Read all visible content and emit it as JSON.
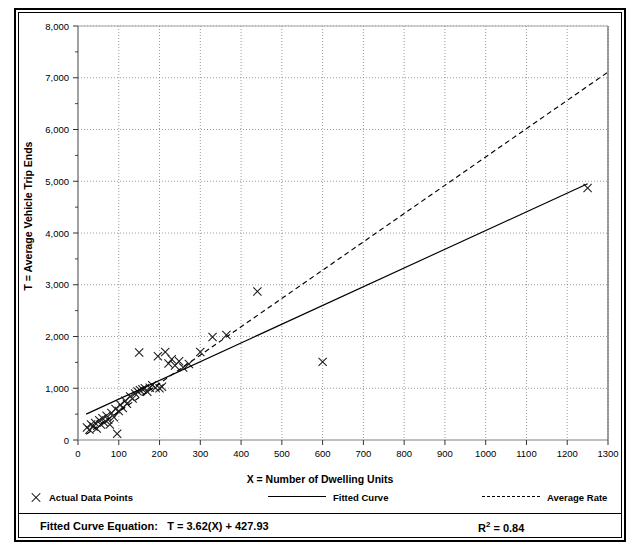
{
  "figure": {
    "title": "",
    "background": "#ffffff",
    "line_color": "#000000"
  },
  "axes": {
    "x_title": "X = Number of Dwelling Units",
    "y_title": "T = Average Vehicle Trip Ends",
    "x_ticks": [
      "0",
      "100",
      "200",
      "300",
      "400",
      "500",
      "600",
      "700",
      "800",
      "900",
      "1000",
      "1100",
      "1200",
      "1300"
    ],
    "y_ticks": [
      "0",
      "1,000",
      "2,000",
      "3,000",
      "4,000",
      "5,000",
      "6,000",
      "7,000",
      "8,000"
    ]
  },
  "legend": {
    "actual_label": "Actual Data Points",
    "fitted_label": "Fitted Curve",
    "average_label": "Average Rate"
  },
  "footer": {
    "equation_label": "Fitted Curve Equation:",
    "equation_value": "T = 3.62(X) + 427.93",
    "rsq_label": "R",
    "rsq_exp": "2",
    "rsq_value": " = 0.84"
  },
  "chart_data": {
    "type": "scatter",
    "title": "",
    "xlabel": "X = Number of Dwelling Units",
    "ylabel": "T = Average Vehicle Trip Ends",
    "xlim": [
      0,
      1300
    ],
    "ylim": [
      0,
      8000
    ],
    "x_major_step": 100,
    "y_major_step": 1000,
    "y_minor_step": 500,
    "grid": true,
    "grid_style": "dotted",
    "legend_position": "below-axes",
    "series": [
      {
        "name": "Actual Data Points",
        "type": "scatter",
        "marker": "x",
        "points": [
          [
            22,
            240
          ],
          [
            28,
            200
          ],
          [
            32,
            300
          ],
          [
            38,
            260
          ],
          [
            42,
            330
          ],
          [
            46,
            220
          ],
          [
            52,
            380
          ],
          [
            56,
            300
          ],
          [
            60,
            420
          ],
          [
            64,
            340
          ],
          [
            70,
            470
          ],
          [
            74,
            390
          ],
          [
            78,
            300
          ],
          [
            82,
            520
          ],
          [
            88,
            440
          ],
          [
            92,
            600
          ],
          [
            96,
            120
          ],
          [
            100,
            560
          ],
          [
            104,
            680
          ],
          [
            110,
            620
          ],
          [
            116,
            760
          ],
          [
            120,
            700
          ],
          [
            128,
            840
          ],
          [
            134,
            800
          ],
          [
            140,
            900
          ],
          [
            146,
            940
          ],
          [
            150,
            1690
          ],
          [
            152,
            960
          ],
          [
            158,
            980
          ],
          [
            164,
            1000
          ],
          [
            170,
            930
          ],
          [
            176,
            1010
          ],
          [
            182,
            1060
          ],
          [
            190,
            1010
          ],
          [
            196,
            1620
          ],
          [
            200,
            1000
          ],
          [
            206,
            1030
          ],
          [
            214,
            1700
          ],
          [
            222,
            1480
          ],
          [
            230,
            1560
          ],
          [
            238,
            1440
          ],
          [
            248,
            1520
          ],
          [
            258,
            1400
          ],
          [
            272,
            1470
          ],
          [
            300,
            1700
          ],
          [
            330,
            1990
          ],
          [
            364,
            2030
          ],
          [
            440,
            2870
          ],
          [
            600,
            1510
          ],
          [
            1250,
            4870
          ]
        ]
      },
      {
        "name": "Fitted Curve",
        "type": "line",
        "style": "solid",
        "slope": 3.62,
        "intercept": 427.93,
        "x_range": [
          20,
          1250
        ],
        "y_range": [
          500,
          4953
        ]
      },
      {
        "name": "Average Rate",
        "type": "line",
        "style": "dashed",
        "rate": 5.47,
        "x_range": [
          20,
          1300
        ],
        "y_range": [
          110,
          7110
        ]
      }
    ]
  }
}
